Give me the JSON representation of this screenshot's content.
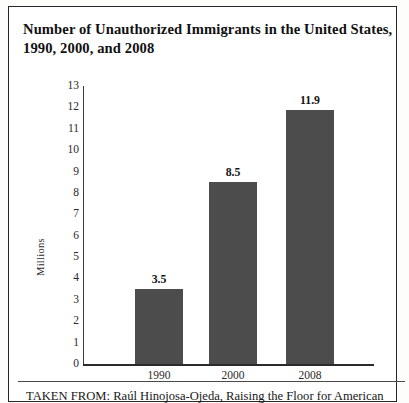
{
  "title": "Number of Unauthorized Immigrants in the United States, 1990, 2000, and 2008",
  "caption": "TAKEN FROM: Raúl Hinojosa-Ojeda, Raising the Floor for American",
  "colors": {
    "bar": "#4c4c4c",
    "axis": "#2b2b2b",
    "text": "#1a1a1a",
    "frame": "#272727"
  },
  "chart_data": {
    "type": "bar",
    "title": "Number of Unauthorized Immigrants in the United States, 1990, 2000, and 2008",
    "categories": [
      "1990",
      "2000",
      "2008"
    ],
    "values": [
      3.5,
      8.5,
      11.9
    ],
    "value_labels": [
      "3.5",
      "8.5",
      "11.9"
    ],
    "xlabel": "",
    "ylabel": "Millions",
    "ylim": [
      0,
      13
    ],
    "yticks": [
      13,
      12,
      11,
      10,
      9,
      8,
      7,
      6,
      5,
      4,
      3,
      2,
      1,
      0
    ],
    "ytick_labels": [
      "13",
      "12",
      "11",
      "10",
      "9",
      "8",
      "7",
      "6",
      "5",
      "4",
      "3",
      "2",
      "1",
      "0"
    ],
    "grid": false,
    "legend": false
  }
}
